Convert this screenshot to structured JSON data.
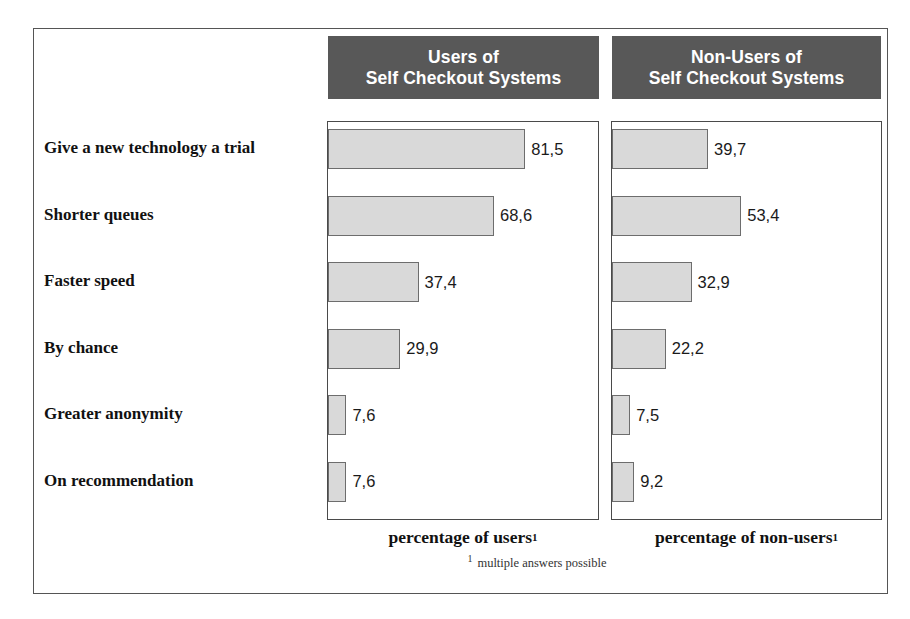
{
  "chart_data": {
    "type": "bar",
    "orientation": "horizontal",
    "title": "",
    "categories": [
      "Give a new technology a trial",
      "Shorter queues",
      "Faster speed",
      "By chance",
      "Greater anonymity",
      "On recommendation"
    ],
    "series": [
      {
        "name": "Users of Self Checkout Systems",
        "header_line1": "Users of",
        "header_line2": "Self Checkout Systems",
        "axis_caption": "percentage of users",
        "axis_caption_sup": "1",
        "values": [
          81.5,
          68.6,
          37.4,
          29.9,
          7.6,
          7.6
        ],
        "value_labels": [
          "81,5",
          "68,6",
          "37,4",
          "29,9",
          "7,6",
          "7,6"
        ]
      },
      {
        "name": "Non-Users of Self Checkout Systems",
        "header_line1": "Non-Users of",
        "header_line2": "Self Checkout Systems",
        "axis_caption": "percentage of non-users",
        "axis_caption_sup": "1",
        "values": [
          39.7,
          53.4,
          32.9,
          22.2,
          7.5,
          9.2
        ],
        "value_labels": [
          "39,7",
          "53,4",
          "32,9",
          "22,2",
          "7,5",
          "9,2"
        ]
      }
    ],
    "xlabel": "",
    "ylabel": "",
    "xlim": [
      0,
      100
    ],
    "grid": false,
    "legend": "none",
    "footnote": "multiple answers possible",
    "footnote_mark": "1",
    "colors": {
      "bar_fill": "#d9d9d9",
      "bar_border": "#6d6d6d",
      "header_band": "#585858",
      "header_text": "#ffffff",
      "frame_border": "#555555",
      "background": "#ffffff",
      "text": "#111111"
    }
  }
}
